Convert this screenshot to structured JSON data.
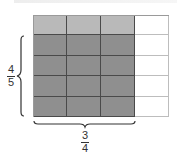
{
  "diagram": {
    "type": "fraction-area-model",
    "grid": {
      "columns": 4,
      "rows": 5,
      "shaded_columns": 3,
      "shaded_rows_dark": 4,
      "cells": [
        [
          "light",
          "light",
          "light",
          "empty"
        ],
        [
          "dark",
          "dark",
          "dark",
          "empty"
        ],
        [
          "dark",
          "dark",
          "dark",
          "empty"
        ],
        [
          "dark",
          "dark",
          "dark",
          "empty"
        ],
        [
          "dark",
          "dark",
          "dark",
          "empty"
        ]
      ]
    },
    "vertical_label": {
      "numerator": "4",
      "denominator": "5"
    },
    "horizontal_label": {
      "numerator": "3",
      "denominator": "4"
    },
    "colors": {
      "light_shade": "#b9b9b9",
      "dark_shade": "#8f8f8f",
      "grid_line": "#4a4a4a",
      "empty": "#ffffff"
    }
  }
}
